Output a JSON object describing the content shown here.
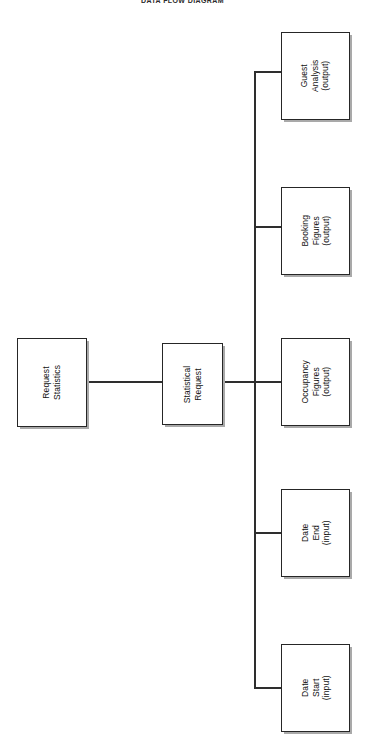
{
  "document": {
    "title": "DATA FLOW DIAGRAM",
    "orientation": "rotated-90",
    "background_color": "#ffffff",
    "line_color": "#2e2e2e",
    "box_border_color": "#262626",
    "text_color": "#111111"
  },
  "nodes": {
    "source": {
      "id": "request-statistics",
      "lines": [
        "Request",
        "Statistics"
      ],
      "line1": "Request",
      "line2": "Statistics",
      "line3": ""
    },
    "process": {
      "id": "statistical-request",
      "lines": [
        "Statistical",
        "Request"
      ],
      "line1": "Statistical",
      "line2": "Request",
      "line3": ""
    },
    "branches": [
      {
        "id": "guest-analysis",
        "line1": "Guest",
        "line2": "Analysis",
        "line3": "(output)",
        "kind": "output"
      },
      {
        "id": "booking-figures",
        "line1": "Booking",
        "line2": "Figures",
        "line3": "(output)",
        "kind": "output"
      },
      {
        "id": "occupancy-figures",
        "line1": "Occupancy",
        "line2": "Figures",
        "line3": "(output)",
        "kind": "output"
      },
      {
        "id": "date-end",
        "line1": "Date",
        "line2": "End",
        "line3": "(input)",
        "kind": "input"
      },
      {
        "id": "date-start",
        "line1": "Date",
        "line2": "Start",
        "line3": "(input)",
        "kind": "input"
      }
    ]
  }
}
